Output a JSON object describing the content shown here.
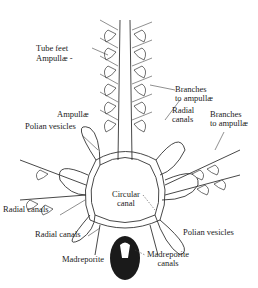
{
  "diagram": {
    "labels": {
      "tube_feet": "Tube feet",
      "ampullae_top": "Ampullæ -",
      "branches_to_ampullae_1": [
        "Branches",
        "to ampullæ"
      ],
      "ampullae_mid": "Ampullæ",
      "radial_canals_top": [
        "Radial",
        "canals"
      ],
      "branches_to_ampullae_2": [
        "Branches",
        "to ampullæ"
      ],
      "polian_vesicles_left": "Polian vesicles",
      "circular_canal": [
        "Circular",
        "canal"
      ],
      "radial_canals_left": "Radial canals",
      "radial_canals_bottom": "Radial canals",
      "polian_vesicles_right": "Polian vesicles",
      "madreporite": "Madreporite",
      "madreporite_canals": [
        "Madreporite",
        "canals"
      ]
    },
    "colors": {
      "line": "#333333",
      "background": "#ffffff",
      "madreporite_fill": "#1a1a1a"
    }
  }
}
